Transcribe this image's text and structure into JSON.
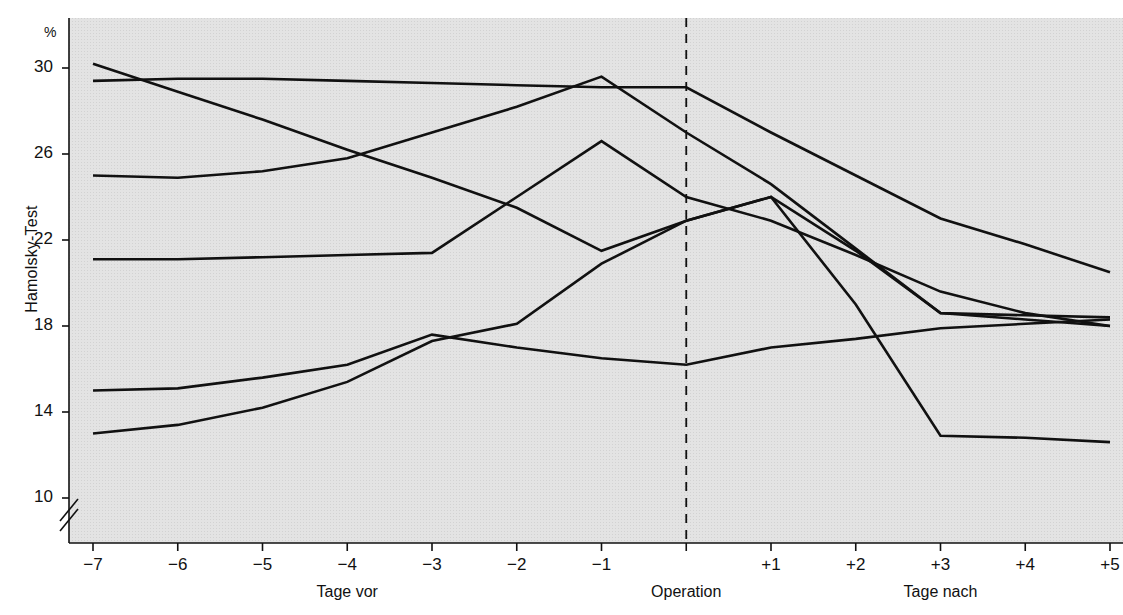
{
  "figure": {
    "unit_label": "%",
    "y_axis_title": "Hamolsky-Test",
    "caption": ""
  },
  "chart_data": {
    "type": "line",
    "title": "",
    "xlabel": "",
    "ylabel": "Hamolsky-Test",
    "unit": "%",
    "grid": false,
    "legend": "none",
    "axis_break": true,
    "x": [
      -7,
      -6,
      -5,
      -4,
      -3,
      -2,
      -1,
      0,
      1,
      2,
      3,
      4,
      5
    ],
    "x_tick_labels": [
      "−7",
      "−6",
      "−5",
      "−4",
      "−3",
      "−2",
      "−1",
      "",
      "+1",
      "+2",
      "+3",
      "+4",
      "+5"
    ],
    "x_group_labels": [
      {
        "text": "Tage vor",
        "at_x": -4
      },
      {
        "text": "Operation",
        "at_x": 0
      },
      {
        "text": "Tage nach",
        "at_x": 3
      }
    ],
    "y_tick_labels": [
      "10",
      "14",
      "18",
      "22",
      "26",
      "30"
    ],
    "y_ticks": [
      10,
      14,
      18,
      22,
      26,
      30
    ],
    "ylim": [
      9.0,
      31.2
    ],
    "xlim": [
      -7.45,
      5.15
    ],
    "marker_line": {
      "at_x": 0,
      "style": "dashed",
      "label": "Operation"
    },
    "series": [
      {
        "name": "Patient 1",
        "values": [
          30.2,
          28.9,
          27.6,
          26.2,
          24.9,
          23.5,
          21.5,
          22.9,
          24.0,
          21.5,
          18.6,
          18.3,
          18.0
        ]
      },
      {
        "name": "Patient 2",
        "values": [
          29.4,
          29.5,
          29.5,
          29.4,
          29.3,
          29.2,
          29.1,
          29.1,
          27.0,
          25.0,
          23.0,
          21.8,
          20.5
        ]
      },
      {
        "name": "Patient 3",
        "values": [
          25.0,
          24.9,
          25.2,
          25.8,
          27.0,
          28.2,
          29.6,
          27.0,
          24.6,
          21.6,
          18.6,
          18.5,
          18.4
        ]
      },
      {
        "name": "Patient 4",
        "values": [
          21.1,
          21.1,
          21.2,
          21.3,
          21.4,
          24.0,
          26.6,
          24.0,
          22.9,
          21.3,
          19.6,
          18.6,
          18.0
        ]
      },
      {
        "name": "Patient 5",
        "values": [
          15.0,
          15.1,
          15.6,
          16.2,
          17.6,
          17.0,
          16.5,
          16.2,
          17.0,
          17.4,
          17.9,
          18.1,
          18.3
        ]
      },
      {
        "name": "Patient 6",
        "values": [
          13.0,
          13.4,
          14.2,
          15.4,
          17.3,
          18.1,
          20.9,
          22.9,
          24.0,
          19.0,
          12.9,
          12.8,
          12.6
        ]
      }
    ],
    "plot_background": "#e3e3e3",
    "line_color": "#111111"
  }
}
